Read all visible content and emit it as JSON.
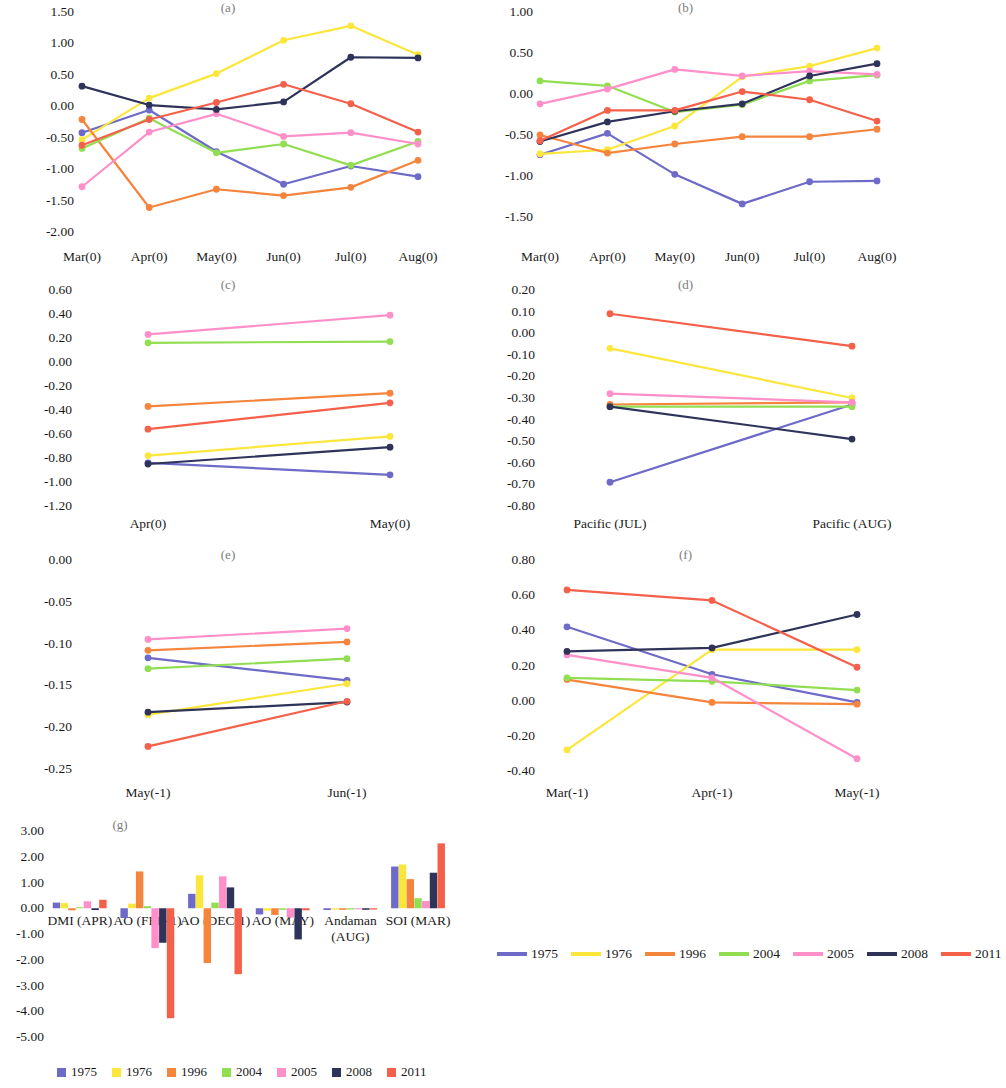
{
  "series_colors": {
    "1975": "#6e6ac8",
    "1976": "#fbe63c",
    "1996": "#f5843c",
    "2004": "#92de52",
    "2005": "#ff8fc9",
    "2008": "#2f3359",
    "2011": "#f4604a"
  },
  "series_names": [
    "1975",
    "1976",
    "1996",
    "2004",
    "2005",
    "2008",
    "2011"
  ],
  "legend_lines": {
    "name": "line-series-legend",
    "items": [
      {
        "label": "1975",
        "color": "#6e6ac8"
      },
      {
        "label": "1976",
        "color": "#fbe63c"
      },
      {
        "label": "1996",
        "color": "#f5843c"
      },
      {
        "label": "2004",
        "color": "#92de52"
      },
      {
        "label": "2005",
        "color": "#ff8fc9"
      },
      {
        "label": "2008",
        "color": "#2f3359"
      },
      {
        "label": "2011",
        "color": "#f4604a"
      }
    ]
  },
  "legend_bars": {
    "name": "bar-series-legend",
    "items": [
      {
        "label": "1975",
        "color": "#6e6ac8"
      },
      {
        "label": "1976",
        "color": "#fbe63c"
      },
      {
        "label": "1996",
        "color": "#f5843c"
      },
      {
        "label": "2004",
        "color": "#92de52"
      },
      {
        "label": "2005",
        "color": "#ff8fc9"
      },
      {
        "label": "2008",
        "color": "#2f3359"
      },
      {
        "label": "2011",
        "color": "#f4604a"
      }
    ]
  },
  "chart_data": [
    {
      "id": "a",
      "type": "line",
      "title": "(a)",
      "xlabel": "",
      "ylabel": "",
      "categories": [
        "Mar(0)",
        "Apr(0)",
        "May(0)",
        "Jun(0)",
        "Jul(0)",
        "Aug(0)"
      ],
      "yticks": [
        "1.50",
        "1.00",
        "0.50",
        "0.00",
        "-0.50",
        "-1.00",
        "-1.50",
        "-2.00"
      ],
      "ylim": [
        -2.0,
        1.5
      ],
      "grid": false,
      "legend_position": "bottom",
      "series": [
        {
          "name": "1975",
          "values": [
            -0.42,
            -0.06,
            -0.72,
            -1.24,
            -0.95,
            -1.12
          ]
        },
        {
          "name": "1976",
          "values": [
            -0.53,
            0.13,
            0.52,
            1.05,
            1.28,
            0.82
          ]
        },
        {
          "name": "1996",
          "values": [
            -0.21,
            -1.61,
            -1.32,
            -1.42,
            -1.29,
            -0.86
          ]
        },
        {
          "name": "2004",
          "values": [
            -0.67,
            -0.19,
            -0.74,
            -0.6,
            -0.94,
            -0.56
          ]
        },
        {
          "name": "2005",
          "values": [
            -1.28,
            -0.41,
            -0.12,
            -0.48,
            -0.42,
            -0.6
          ]
        },
        {
          "name": "2008",
          "values": [
            0.32,
            0.02,
            -0.05,
            0.07,
            0.78,
            0.77
          ]
        },
        {
          "name": "2011",
          "values": [
            -0.62,
            -0.21,
            0.06,
            0.35,
            0.04,
            -0.41
          ]
        }
      ]
    },
    {
      "id": "b",
      "type": "line",
      "title": "(b)",
      "xlabel": "",
      "ylabel": "",
      "categories": [
        "Mar(0)",
        "Apr(0)",
        "May(0)",
        "Jun(0)",
        "Jul(0)",
        "Aug(0)"
      ],
      "yticks": [
        "1.00",
        "0.50",
        "0.00",
        "-0.50",
        "-1.00",
        "-1.50"
      ],
      "ylim": [
        -1.5,
        1.0
      ],
      "grid": false,
      "legend_position": "bottom",
      "series": [
        {
          "name": "1975",
          "values": [
            -0.74,
            -0.48,
            -0.98,
            -1.34,
            -1.07,
            -1.06
          ]
        },
        {
          "name": "1976",
          "values": [
            -0.73,
            -0.68,
            -0.39,
            0.21,
            0.34,
            0.56
          ]
        },
        {
          "name": "1996",
          "values": [
            -0.5,
            -0.72,
            -0.61,
            -0.52,
            -0.52,
            -0.43
          ]
        },
        {
          "name": "2004",
          "values": [
            0.16,
            0.1,
            -0.22,
            -0.13,
            0.16,
            0.23
          ]
        },
        {
          "name": "2005",
          "values": [
            -0.12,
            0.06,
            0.3,
            0.22,
            0.28,
            0.24
          ]
        },
        {
          "name": "2008",
          "values": [
            -0.58,
            -0.34,
            -0.21,
            -0.12,
            0.22,
            0.37
          ]
        },
        {
          "name": "2011",
          "values": [
            -0.57,
            -0.2,
            -0.2,
            0.03,
            -0.07,
            -0.33
          ]
        }
      ]
    },
    {
      "id": "c",
      "type": "line",
      "title": "(c)",
      "xlabel": "",
      "ylabel": "",
      "categories": [
        "Apr(0)",
        "May(0)"
      ],
      "yticks": [
        "0.60",
        "0.40",
        "0.20",
        "0.00",
        "-0.20",
        "-0.40",
        "-0.60",
        "-0.80",
        "-1.00",
        "-1.20"
      ],
      "ylim": [
        -1.2,
        0.6
      ],
      "grid": false,
      "legend_position": "bottom",
      "series": [
        {
          "name": "1975",
          "values": [
            -0.84,
            -0.94
          ]
        },
        {
          "name": "1976",
          "values": [
            -0.78,
            -0.62
          ]
        },
        {
          "name": "1996",
          "values": [
            -0.37,
            -0.26
          ]
        },
        {
          "name": "2004",
          "values": [
            0.16,
            0.17
          ]
        },
        {
          "name": "2005",
          "values": [
            0.23,
            0.39
          ]
        },
        {
          "name": "2008",
          "values": [
            -0.85,
            -0.71
          ]
        },
        {
          "name": "2011",
          "values": [
            -0.56,
            -0.34
          ]
        }
      ]
    },
    {
      "id": "d",
      "type": "line",
      "title": "(d)",
      "xlabel": "",
      "ylabel": "",
      "categories": [
        "Pacific (JUL)",
        "Pacific (AUG)"
      ],
      "yticks": [
        "0.20",
        "0.10",
        "0.00",
        "-0.10",
        "-0.20",
        "-0.30",
        "-0.40",
        "-0.50",
        "-0.60",
        "-0.70",
        "-0.80"
      ],
      "ylim": [
        -0.8,
        0.2
      ],
      "grid": false,
      "legend_position": "bottom",
      "series": [
        {
          "name": "1975",
          "values": [
            -0.69,
            -0.33
          ]
        },
        {
          "name": "1976",
          "values": [
            -0.07,
            -0.3
          ]
        },
        {
          "name": "1996",
          "values": [
            -0.33,
            -0.32
          ]
        },
        {
          "name": "2004",
          "values": [
            -0.34,
            -0.34
          ]
        },
        {
          "name": "2005",
          "values": [
            -0.28,
            -0.32
          ]
        },
        {
          "name": "2008",
          "values": [
            -0.34,
            -0.49
          ]
        },
        {
          "name": "2011",
          "values": [
            0.09,
            -0.06
          ]
        }
      ]
    },
    {
      "id": "e",
      "type": "line",
      "title": "(e)",
      "xlabel": "",
      "ylabel": "",
      "categories": [
        "May(-1)",
        "Jun(-1)"
      ],
      "yticks": [
        "0.00",
        "-0.05",
        "-0.10",
        "-0.15",
        "-0.20",
        "-0.25"
      ],
      "ylim": [
        -0.25,
        0.0
      ],
      "grid": false,
      "legend_position": "bottom",
      "series": [
        {
          "name": "1975",
          "values": [
            -0.117,
            -0.144
          ]
        },
        {
          "name": "1976",
          "values": [
            -0.185,
            -0.148
          ]
        },
        {
          "name": "1996",
          "values": [
            -0.108,
            -0.098
          ]
        },
        {
          "name": "2004",
          "values": [
            -0.13,
            -0.118
          ]
        },
        {
          "name": "2005",
          "values": [
            -0.095,
            -0.082
          ]
        },
        {
          "name": "2008",
          "values": [
            -0.182,
            -0.17
          ]
        },
        {
          "name": "2011",
          "values": [
            -0.223,
            -0.169
          ]
        }
      ]
    },
    {
      "id": "f",
      "type": "line",
      "title": "(f)",
      "xlabel": "",
      "ylabel": "",
      "categories": [
        "Mar(-1)",
        "Apr(-1)",
        "May(-1)"
      ],
      "yticks": [
        "0.80",
        "0.60",
        "0.40",
        "0.20",
        "0.00",
        "-0.20",
        "-0.40"
      ],
      "ylim": [
        -0.4,
        0.8
      ],
      "grid": false,
      "legend_position": "bottom",
      "series": [
        {
          "name": "1975",
          "values": [
            0.42,
            0.15,
            -0.01
          ]
        },
        {
          "name": "1976",
          "values": [
            -0.28,
            0.29,
            0.29
          ]
        },
        {
          "name": "1996",
          "values": [
            0.12,
            -0.01,
            -0.02
          ]
        },
        {
          "name": "2004",
          "values": [
            0.13,
            0.11,
            0.06
          ]
        },
        {
          "name": "2005",
          "values": [
            0.26,
            0.13,
            -0.33
          ]
        },
        {
          "name": "2008",
          "values": [
            0.28,
            0.3,
            0.49
          ]
        },
        {
          "name": "2011",
          "values": [
            0.63,
            0.57,
            0.19
          ]
        }
      ]
    },
    {
      "id": "g",
      "type": "bar",
      "title": "(g)",
      "xlabel": "",
      "ylabel": "",
      "categories": [
        "DMI (APR)",
        "AO (FEB-1)",
        "AO (DEC-1)",
        "AO (MAY)",
        "Andaman (AUG)",
        "SOI (MAR)"
      ],
      "yticks": [
        "3.00",
        "2.00",
        "1.00",
        "0.00",
        "-1.00",
        "-2.00",
        "-3.00",
        "-4.00",
        "-5.00"
      ],
      "ylim": [
        -5.0,
        3.0
      ],
      "grid": false,
      "legend_position": "bottom",
      "series": [
        {
          "name": "1975",
          "values": [
            0.22,
            -0.38,
            0.56,
            -0.24,
            -0.07,
            1.62
          ]
        },
        {
          "name": "1976",
          "values": [
            0.2,
            0.18,
            1.28,
            -0.09,
            -0.05,
            1.7
          ]
        },
        {
          "name": "1996",
          "values": [
            -0.08,
            1.43,
            -2.13,
            -0.26,
            -0.06,
            1.13
          ]
        },
        {
          "name": "2004",
          "values": [
            0.04,
            0.08,
            0.22,
            -0.06,
            -0.05,
            0.39
          ]
        },
        {
          "name": "2005",
          "values": [
            0.27,
            -1.55,
            1.24,
            -0.36,
            -0.04,
            0.28
          ]
        },
        {
          "name": "2008",
          "values": [
            -0.07,
            -1.34,
            0.81,
            -1.21,
            -0.06,
            1.38
          ]
        },
        {
          "name": "2011",
          "values": [
            0.33,
            -4.27,
            -2.56,
            -0.08,
            -0.05,
            2.52
          ]
        }
      ]
    }
  ]
}
